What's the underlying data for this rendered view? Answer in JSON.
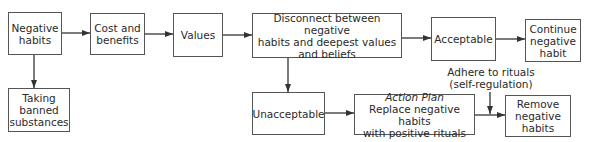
{
  "diagram": {
    "type": "flowchart",
    "nodes": {
      "negative_habits": {
        "lines": [
          "Negative",
          "habits"
        ]
      },
      "cost_benefits": {
        "lines": [
          "Cost and",
          "benefits"
        ]
      },
      "values": {
        "lines": [
          "Values"
        ]
      },
      "disconnect": {
        "lines": [
          "Disconnect between negative",
          "habits and deepest values",
          "and beliefs"
        ]
      },
      "acceptable": {
        "lines": [
          "Acceptable"
        ]
      },
      "continue": {
        "lines": [
          "Continue",
          "negative",
          "habit"
        ]
      },
      "taking_banned": {
        "lines": [
          "Taking",
          "banned",
          "substances"
        ]
      },
      "unacceptable": {
        "lines": [
          "Unacceptable"
        ]
      },
      "action_plan": {
        "title": "Action Plan",
        "lines": [
          "Replace negative habits",
          "with positive rituals"
        ]
      },
      "remove": {
        "lines": [
          "Remove",
          "negative",
          "habits"
        ]
      }
    },
    "annotation": {
      "lines": [
        "Adhere to rituals",
        "(self-regulation)"
      ]
    },
    "edges": [
      [
        "negative_habits",
        "cost_benefits"
      ],
      [
        "cost_benefits",
        "values"
      ],
      [
        "values",
        "disconnect"
      ],
      [
        "disconnect",
        "acceptable"
      ],
      [
        "acceptable",
        "continue"
      ],
      [
        "negative_habits",
        "taking_banned"
      ],
      [
        "disconnect",
        "unacceptable"
      ],
      [
        "unacceptable",
        "action_plan"
      ],
      [
        "action_plan",
        "remove"
      ],
      [
        "annotation",
        "action_plan-remove edge"
      ]
    ]
  }
}
